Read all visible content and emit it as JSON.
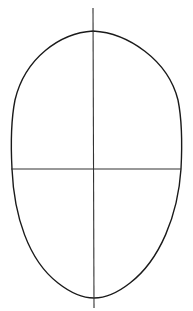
{
  "figure": {
    "stroke_color": "#1a1a1a",
    "background_color": "#ffffff",
    "outline": {
      "shape": "egg",
      "top": [
        93,
        31
      ],
      "bottom": [
        94,
        298
      ],
      "left_x": 11,
      "right_x": 182
    },
    "vertical_guide": {
      "x": 93,
      "y1": 8,
      "y2": 308
    },
    "horizontal_guide": {
      "y": 169,
      "x1": 11,
      "x2": 181
    }
  }
}
